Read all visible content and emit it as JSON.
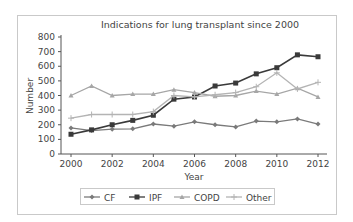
{
  "chart_data": {
    "type": "line",
    "title": "Indications for lung transplant since 2000",
    "xlabel": "Year",
    "ylabel": "Number",
    "x": [
      2000,
      2001,
      2002,
      2003,
      2004,
      2005,
      2006,
      2007,
      2008,
      2009,
      2010,
      2011,
      2012
    ],
    "xticks": [
      2000,
      2002,
      2004,
      2006,
      2008,
      2010,
      2012
    ],
    "yticks": [
      0,
      100,
      200,
      300,
      400,
      500,
      600,
      700,
      800
    ],
    "ylim": [
      0,
      800
    ],
    "xlim": [
      2000,
      2012
    ],
    "grid": false,
    "legend_position": "bottom",
    "series": [
      {
        "name": "CF",
        "color": "#7a7a7a",
        "marker": "diamond",
        "values": [
          178,
          160,
          170,
          172,
          205,
          190,
          220,
          200,
          185,
          225,
          220,
          240,
          205
        ]
      },
      {
        "name": "IPF",
        "color": "#3a3a3a",
        "marker": "square",
        "values": [
          135,
          165,
          200,
          230,
          265,
          375,
          390,
          465,
          485,
          548,
          590,
          678,
          665
        ]
      },
      {
        "name": "COPD",
        "color": "#a6a6a6",
        "marker": "triangle",
        "values": [
          400,
          465,
          400,
          410,
          410,
          440,
          420,
          395,
          400,
          430,
          410,
          450,
          390
        ]
      },
      {
        "name": "Other",
        "color": "#b4b4b4",
        "marker": "cross",
        "values": [
          245,
          270,
          270,
          270,
          290,
          400,
          390,
          405,
          420,
          460,
          555,
          445,
          490
        ]
      }
    ]
  },
  "legend": {
    "items": [
      "CF",
      "IPF",
      "COPD",
      "Other"
    ]
  }
}
